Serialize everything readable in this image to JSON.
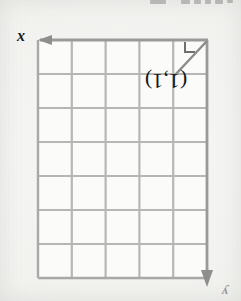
{
  "page": {
    "width": 241,
    "height": 301,
    "background_color": "#f3f3f1",
    "media": "scanned-worksheet-photo",
    "orientation_note": "page appears rotated 180 degrees; coordinate text reads upside-down"
  },
  "header": {
    "cut_off_text": "",
    "visible": true
  },
  "figure": {
    "type": "coordinate-grid",
    "grid": {
      "columns": 5,
      "rows": 7,
      "left": 38,
      "top": 40,
      "right": 207,
      "bottom": 278,
      "cell_width": 33.8,
      "cell_height": 34.0,
      "line_color": "#b6b6b6",
      "axis_color": "#9a9a9a",
      "cell_fill": "#fafaf8"
    },
    "x_axis": {
      "label": "x",
      "arrow_direction": "left",
      "arrow_tip_x": 40,
      "arrow_y": 40
    },
    "y_axis": {
      "label": "y",
      "arrow_direction": "down",
      "arrow_x": 207,
      "arrow_tip_y": 286
    },
    "point_label": {
      "text": "(1,1)",
      "rendered_as": "(1'1)",
      "x": 145,
      "y": 70
    },
    "right_angle_marker": {
      "present": true,
      "x": 186,
      "y": 44,
      "size": 10,
      "color": "#6f6f6f"
    },
    "hypotenuse": {
      "present": true,
      "from": [
        176,
        74
      ],
      "to": [
        206,
        42
      ],
      "color": "#8b8b8b",
      "description": "diagonal line across the top-right grid cell"
    }
  },
  "colors": {
    "paper": "#f3f3f1",
    "grid_line": "#b6b6b6",
    "axis_line": "#9a9a9a",
    "ink_dark": "#1d1d1d",
    "ink_mid": "#6f6f6f"
  }
}
